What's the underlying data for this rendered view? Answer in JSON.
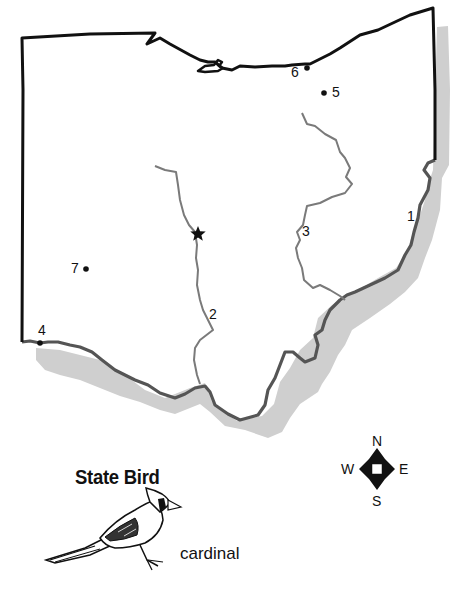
{
  "map": {
    "state": "Ohio",
    "capital_marker": "star-icon",
    "labeled_points": [
      {
        "label": "1",
        "type": "river-label"
      },
      {
        "label": "2",
        "type": "river-label"
      },
      {
        "label": "3",
        "type": "river-label"
      },
      {
        "label": "4",
        "type": "city-dot"
      },
      {
        "label": "5",
        "type": "city-dot"
      },
      {
        "label": "6",
        "type": "city-dot"
      },
      {
        "label": "7",
        "type": "city-dot"
      }
    ],
    "colors": {
      "border": "#111111",
      "river_border": "#555555",
      "river": "#7a7a7a",
      "neighbor_shadow": "#cfcfcf"
    }
  },
  "compass": {
    "n": "N",
    "s": "S",
    "e": "E",
    "w": "W"
  },
  "state_bird": {
    "heading": "State Bird",
    "name": "cardinal"
  }
}
